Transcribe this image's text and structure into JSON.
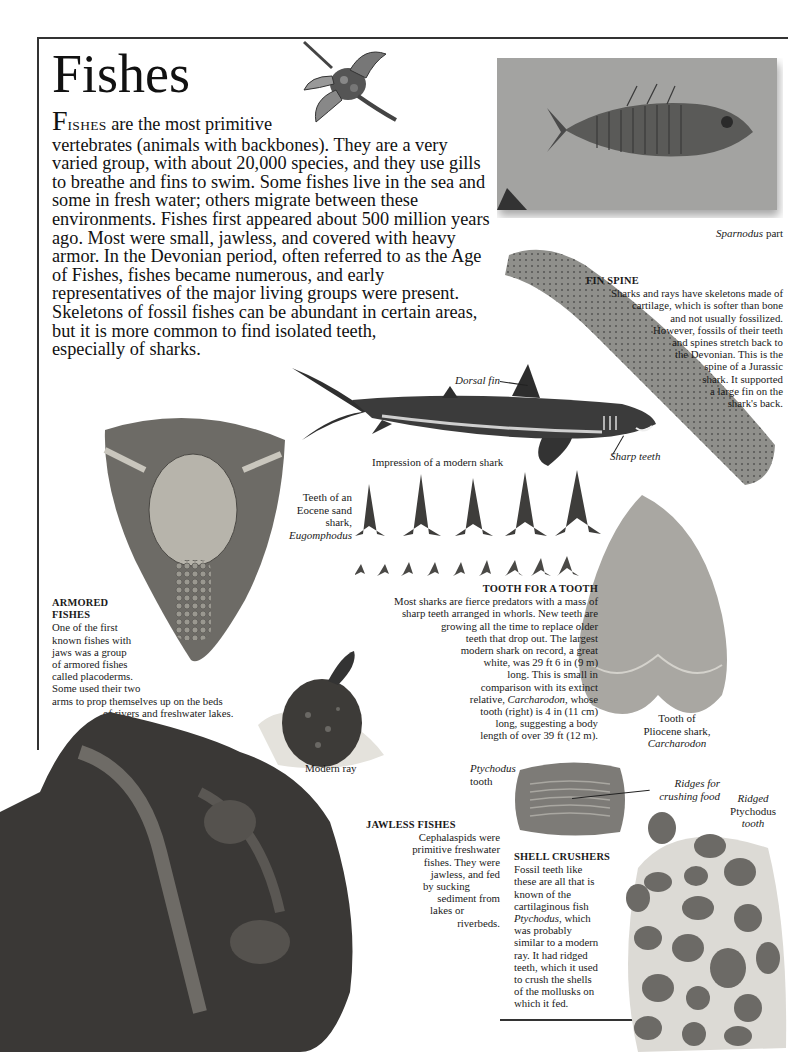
{
  "page": {
    "title": "Fishes",
    "intro": {
      "drop_cap": "F",
      "small_caps": "ISHES",
      "first_line_rest": " are the most primitive",
      "body": "vertebrates (animals with backbones). They are a very varied group, with about 20,000 species, and they use gills to breathe and fins to swim. Some fishes live in the sea and some in fresh water; others migrate between these environments. Fishes first appeared about 500 million years ago. Most were small, jawless, and covered with heavy armor. In the Devonian period, often referred to as the Age of Fishes, fishes became numerous, and early representatives of the major living groups were present. Skeletons of fossil fishes can be abundant in certain areas, but it is more common to find isolated teeth,",
      "last_line": "especially of sharks."
    }
  },
  "images": {
    "dragon_fish": "spiny-fish-illustration",
    "sparnodus": "sparnodus-fossil",
    "fin_spine": "fin-spine-fossil",
    "shark": "modern-shark-illustration",
    "placoderm": "placoderm-fossil",
    "eocene_teeth": "eocene-shark-teeth",
    "carcharodon_tooth": "carcharodon-tooth",
    "ray": "modern-ray-illustration",
    "cephalaspid": "cephalaspid-fossil-slab",
    "ptychodus_tooth": "ptychodus-tooth",
    "ptychodus_slab": "ptychodus-teeth-slab"
  },
  "labels": {
    "sparnodus_italic": "Sparnodus",
    "sparnodus_rest": " part",
    "dorsal_fin": "Dorsal fin",
    "sharp_teeth": "Sharp teeth",
    "shark_impression": "Impression of a modern shark",
    "eocene_teeth_line1": "Teeth  of an",
    "eocene_teeth_line2": "Eocene sand",
    "eocene_teeth_line3": "shark,",
    "eocene_teeth_line4": "Eugomphodus",
    "carcharodon_line1": "Tooth of",
    "carcharodon_line2": "Pliocene shark,",
    "carcharodon_line3": "Carcharodon",
    "modern_ray": "Modern ray",
    "ptychodus_tooth_line1": "Ptychodus",
    "ptychodus_tooth_line2": "tooth",
    "ridges_line1": "Ridges for",
    "ridges_line2": "crushing food",
    "ridged_line1": "Ridged",
    "ridged_line2": "Ptychodus",
    "ridged_line3": "tooth"
  },
  "captions": {
    "fin_spine": {
      "heading": "FIN SPINE",
      "lines": [
        "Sharks and rays have skeletons made of",
        "cartilage, which is softer than bone",
        "and not usually fossilized.",
        "However, fossils of their teeth",
        "and spines stretch back to",
        "the Devonian. This is the",
        "spine of a Jurassic",
        "shark. It supported",
        "a large fin on the",
        "shark's back."
      ]
    },
    "tooth_for_a_tooth": {
      "heading": "TOOTH FOR A TOOTH",
      "lines": [
        "Most sharks are fierce predators with a mass of",
        "sharp teeth arranged in whorls. New teeth are",
        "growing all the time to replace older",
        "teeth that drop out. The largest",
        "modern shark on record, a great",
        "white, was 29 ft 6 in (9 m)",
        "long. This is small in",
        "comparison with its extinct"
      ],
      "relative_prefix": "relative, ",
      "relative_italic": "Carcharodon",
      "relative_suffix": ", whose",
      "lines_after": [
        "tooth (right) is 4 in (11 cm)",
        "long, suggesting a body",
        "length of over 39 ft (12 m)."
      ]
    },
    "armored_fishes": {
      "heading_line1": "ARMORED",
      "heading_line2": "FISHES",
      "lines": [
        "One of the first",
        "known fishes with",
        "jaws was a group",
        "of armored fishes",
        "called placoderms.",
        "Some used their two",
        "arms to prop themselves up on the beds",
        "of rivers and freshwater lakes."
      ]
    },
    "jawless_fishes": {
      "heading": "JAWLESS  FISHES",
      "lines": [
        "Cephalaspids were",
        "primitive freshwater",
        "fishes. They were",
        "jawless, and fed",
        "by sucking",
        "sediment from",
        "lakes or",
        "riverbeds."
      ]
    },
    "shell_crushers": {
      "heading": "SHELL CRUSHERS",
      "lines_before": [
        "Fossil teeth like",
        "these are all that is",
        "known of the",
        "cartilaginous fish"
      ],
      "italic_word": "Ptychodus",
      "italic_suffix": ", which",
      "lines_after": [
        "was probably",
        "similar to a modern",
        "ray. It had ridged",
        "teeth, which it used",
        "to crush the shells",
        "of the mollusks on",
        "which it fed."
      ]
    }
  }
}
